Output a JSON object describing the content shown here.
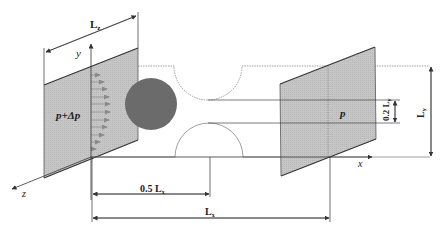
{
  "diagram": {
    "type": "schematic",
    "labels": {
      "lz": "L",
      "lz_sub": "z",
      "y_axis": "y",
      "z_axis": "z",
      "x_axis": "x",
      "inlet_pressure": "p+Δp",
      "outlet_pressure": "p",
      "half_lx": "0.5 L",
      "half_lx_sub": "x",
      "lx": "L",
      "lx_sub": "x",
      "ly": "L",
      "ly_sub": "y",
      "gap": "0.2 L",
      "gap_sub": "y"
    },
    "colors": {
      "plane_fill": "#c4c4c4",
      "cylinder_fill": "#6b6b6b",
      "line": "#333333",
      "flow_arrow": "#8a8a8a",
      "wall": "#888888"
    }
  }
}
